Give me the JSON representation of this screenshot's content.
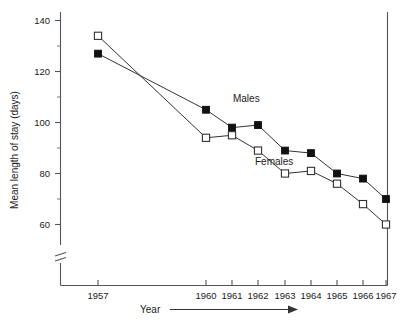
{
  "chart_data": {
    "type": "line",
    "title": "",
    "xlabel": "Year",
    "ylabel": "Mean length of stay (days)",
    "categories": [
      "1957",
      "1960",
      "1961",
      "1962",
      "1963",
      "1964",
      "1965",
      "1966",
      "1967"
    ],
    "x": [
      1957,
      1960,
      1961,
      1962,
      1963,
      1964,
      1965,
      1966,
      1967
    ],
    "series": [
      {
        "name": "Males",
        "marker": "filled-square",
        "values": [
          127,
          105,
          98,
          99,
          89,
          88,
          80,
          78,
          70
        ]
      },
      {
        "name": "Females",
        "marker": "open-square",
        "values": [
          134,
          94,
          95,
          89,
          80,
          81,
          76,
          68,
          60
        ]
      }
    ],
    "ylim": [
      50,
      145
    ],
    "y_ticks_major": [
      60,
      80,
      100,
      120,
      140
    ],
    "y_tick_labels": [
      "60",
      "80",
      "100",
      "120",
      "140"
    ],
    "y_ticks_minor": [
      70,
      90,
      110,
      130
    ],
    "grid": false,
    "legend": "inline-annotations",
    "y_axis_break": true,
    "x_axis_arrow": true,
    "annotations": [
      {
        "label": "Males",
        "x": 1961.55,
        "y": 108
      },
      {
        "label": "Females",
        "x": 1962.6,
        "y": 83.5
      }
    ]
  },
  "axis": {
    "y_title": "Mean length of stay (days)",
    "x_title": "Year"
  },
  "colors": {
    "axis": "#555555",
    "line": "#333333",
    "marker_filled": "#111111",
    "marker_open_fill": "#ffffff",
    "text": "#1a1a1a",
    "background": "#ffffff"
  }
}
